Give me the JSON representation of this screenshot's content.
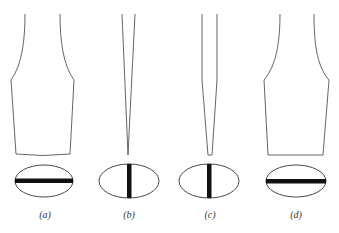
{
  "figure": {
    "panels": [
      {
        "id": "a",
        "label": "(a)",
        "tip": "wide flared blade",
        "slot": "horizontal"
      },
      {
        "id": "b",
        "label": "(b)",
        "tip": "narrow pointed tip",
        "slot": "vertical"
      },
      {
        "id": "c",
        "label": "(c)",
        "tip": "narrow stepped blunt tip",
        "slot": "vertical"
      },
      {
        "id": "d",
        "label": "(d)",
        "tip": "wide flared flat blade",
        "slot": "horizontal"
      }
    ]
  }
}
